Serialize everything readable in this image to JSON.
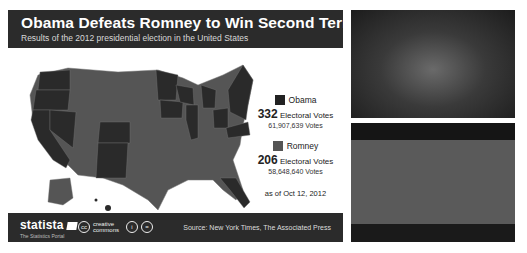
{
  "infographic": {
    "title": "Obama Defeats Romney to Win Second Term",
    "subtitle": "Results of the 2012 presidential election in the United States",
    "legend": {
      "obama": {
        "name": "Obama",
        "electoral_votes": "332",
        "ev_label": "Electoral Votes",
        "popular_votes": "61,907,639 Votes",
        "color": "#222222"
      },
      "romney": {
        "name": "Romney",
        "electoral_votes": "206",
        "ev_label": "Electoral Votes",
        "popular_votes": "58,648,640 Votes",
        "color": "#555555"
      }
    },
    "as_of": "as of Oct 12, 2012",
    "footer": {
      "logo": "statista",
      "logo_tagline": "The Statistics Portal",
      "license": "creative commons",
      "license_icons": [
        "attribution-icon",
        "noderivs-icon"
      ],
      "source": "Source: New York Times, The Associated Press"
    }
  },
  "photos": [
    {
      "name": "victory-rally-photo",
      "description": "Crowd celebrating on stage"
    },
    {
      "name": "candidates-greeting-photo",
      "description": "Candidates greeting each other"
    }
  ]
}
